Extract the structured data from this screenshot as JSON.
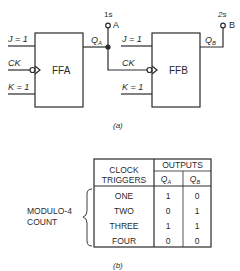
{
  "figure_a": {
    "caption": "(a)",
    "ffa": {
      "label": "FFA",
      "j_input": "J = 1",
      "ck_input": "CK",
      "k_input": "K = 1",
      "output_label": "Q",
      "output_sub": "A"
    },
    "ffb": {
      "label": "FFB",
      "j_input": "J = 1",
      "ck_input": "CK",
      "k_input": "K = 1",
      "output_label": "Q",
      "output_sub": "B"
    },
    "terminal_a": {
      "label": "A",
      "weight": "1s"
    },
    "terminal_b": {
      "label": "B",
      "weight": "2s"
    }
  },
  "figure_b": {
    "caption": "(b)",
    "brace_label_line1": "MODULO-4",
    "brace_label_line2": "COUNT",
    "table": {
      "header_col1_line1": "CLOCK",
      "header_col1_line2": "TRIGGERS",
      "header_group": "OUTPUTS",
      "header_qa": "Q",
      "header_qa_sub": "A",
      "header_qb": "Q",
      "header_qb_sub": "B",
      "rows": [
        {
          "trigger": "ONE",
          "qa": "1",
          "qb": "0"
        },
        {
          "trigger": "TWO",
          "qa": "0",
          "qb": "1"
        },
        {
          "trigger": "THREE",
          "qa": "1",
          "qb": "1"
        },
        {
          "trigger": "FOUR",
          "qa": "0",
          "qb": "0"
        }
      ]
    }
  }
}
